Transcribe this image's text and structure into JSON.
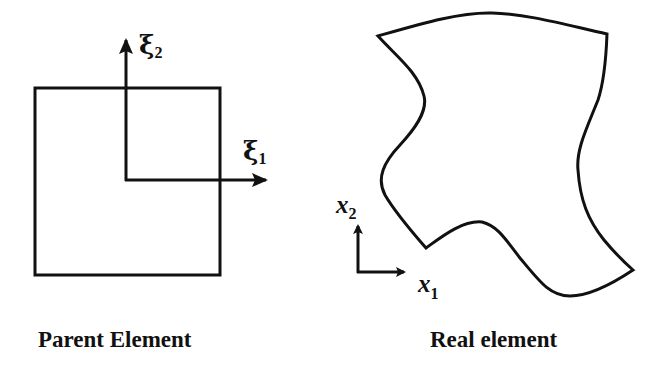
{
  "diagram": {
    "type": "isoparametric-mapping",
    "colors": {
      "stroke": "#111111",
      "background": "#ffffff"
    },
    "parent_element": {
      "caption": "Parent Element",
      "shape": "square",
      "axes": [
        {
          "symbol": "ξ",
          "subscript": "1",
          "direction": "horizontal"
        },
        {
          "symbol": "ξ",
          "subscript": "2",
          "direction": "vertical"
        }
      ]
    },
    "real_element": {
      "caption": "Real element",
      "shape": "curved quadrilateral",
      "axes": [
        {
          "symbol": "x",
          "subscript": "1",
          "direction": "horizontal"
        },
        {
          "symbol": "x",
          "subscript": "2",
          "direction": "vertical"
        }
      ]
    }
  }
}
